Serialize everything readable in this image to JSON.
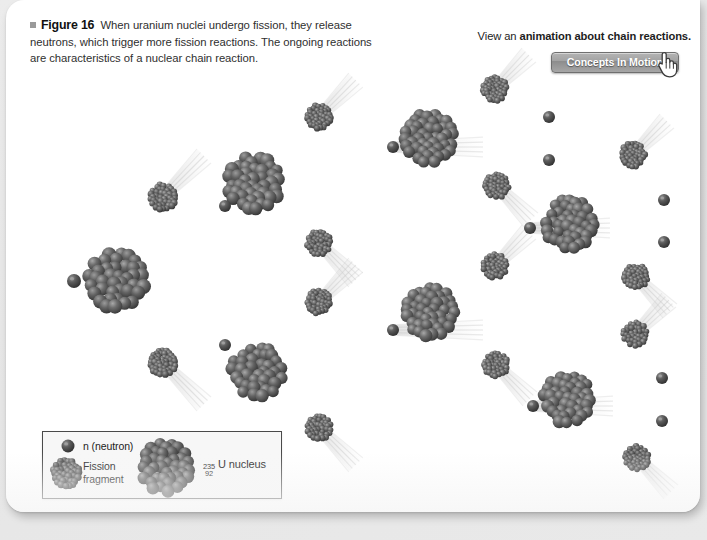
{
  "figure": {
    "bullet": "■",
    "label": "Figure 16",
    "caption": "When uranium nuclei undergo fission, they release neutrons, which trigger more fission reactions. The ongoing reactions are characteristics of a nuclear chain reaction."
  },
  "animation_note": {
    "prefix": "View an ",
    "bold": "animation about chain reactions."
  },
  "button": {
    "label": "Concepts In Motion",
    "cursor_icon": "hand-pointer-icon"
  },
  "legend": {
    "neutron_label": "n (neutron)",
    "fragment_label_line1": "Fission",
    "fragment_label_line2": "fragment",
    "uranium_mass_number": "235",
    "uranium_atomic_number": "92",
    "uranium_label": "U nucleus"
  },
  "colors": {
    "page_background": "#e8e8e8",
    "card": "#ffffff",
    "nucleon_dark": "#4a4a4a",
    "nucleon_mid": "#5e5e5e",
    "nucleon_light": "#8e8e8e",
    "trail": "#cfcfcf",
    "button_gray": "#a2a2a2",
    "legend_border": "#4a4a4a",
    "text": "#2e2e2e"
  },
  "diagram": {
    "type": "nuclear-chain-reaction-schematic",
    "generations": 3,
    "uranium_nuclei": [
      {
        "id": "u-gen1",
        "cx": 110,
        "cy": 281,
        "r": 33,
        "generation": 1
      },
      {
        "id": "u-gen2-top",
        "cx": 248,
        "cy": 183,
        "r": 31,
        "generation": 2
      },
      {
        "id": "u-gen2-bottom",
        "cx": 251,
        "cy": 372,
        "r": 30,
        "generation": 2
      },
      {
        "id": "u-gen3-a",
        "cx": 423,
        "cy": 138,
        "r": 29,
        "generation": 3
      },
      {
        "id": "u-gen3-b",
        "cx": 563,
        "cy": 224,
        "r": 29,
        "generation": 3
      },
      {
        "id": "u-gen3-c",
        "cx": 424,
        "cy": 312,
        "r": 29,
        "generation": 3
      },
      {
        "id": "u-gen3-d",
        "cx": 562,
        "cy": 399,
        "r": 29,
        "generation": 3
      }
    ],
    "fission_fragments": [
      {
        "id": "f1",
        "cx": 157,
        "cy": 197,
        "r": 15
      },
      {
        "id": "f2",
        "cx": 157,
        "cy": 363,
        "r": 15
      },
      {
        "id": "f3",
        "cx": 313,
        "cy": 117,
        "r": 14
      },
      {
        "id": "f4",
        "cx": 313,
        "cy": 243,
        "r": 14
      },
      {
        "id": "f5",
        "cx": 313,
        "cy": 302,
        "r": 14
      },
      {
        "id": "f6",
        "cx": 313,
        "cy": 428,
        "r": 14
      },
      {
        "id": "f7",
        "cx": 489,
        "cy": 89,
        "r": 14
      },
      {
        "id": "f8",
        "cx": 491,
        "cy": 186,
        "r": 14
      },
      {
        "id": "f9",
        "cx": 627,
        "cy": 155,
        "r": 14
      },
      {
        "id": "f10",
        "cx": 630,
        "cy": 277,
        "r": 14
      },
      {
        "id": "f11",
        "cx": 489,
        "cy": 266,
        "r": 14
      },
      {
        "id": "f12",
        "cx": 490,
        "cy": 365,
        "r": 14
      },
      {
        "id": "f13",
        "cx": 629,
        "cy": 334,
        "r": 14
      },
      {
        "id": "f14",
        "cx": 631,
        "cy": 458,
        "r": 14
      }
    ],
    "neutrons": [
      {
        "id": "n-incoming",
        "cx": 68,
        "cy": 281,
        "r": 7
      },
      {
        "id": "n-a",
        "cx": 219,
        "cy": 206,
        "r": 6
      },
      {
        "id": "n-b",
        "cx": 219,
        "cy": 345,
        "r": 6
      },
      {
        "id": "n-c",
        "cx": 387,
        "cy": 147,
        "r": 6
      },
      {
        "id": "n-d",
        "cx": 387,
        "cy": 330,
        "r": 6
      },
      {
        "id": "n-e",
        "cx": 524,
        "cy": 228,
        "r": 6
      },
      {
        "id": "n-f",
        "cx": 527,
        "cy": 406,
        "r": 6
      },
      {
        "id": "n-g",
        "cx": 543,
        "cy": 117,
        "r": 6
      },
      {
        "id": "n-h",
        "cx": 543,
        "cy": 160,
        "r": 6
      },
      {
        "id": "n-i",
        "cx": 658,
        "cy": 200,
        "r": 6
      },
      {
        "id": "n-j",
        "cx": 658,
        "cy": 242,
        "r": 6
      },
      {
        "id": "n-k",
        "cx": 656,
        "cy": 378,
        "r": 6
      },
      {
        "id": "n-l",
        "cx": 656,
        "cy": 421,
        "r": 6
      }
    ],
    "motion_trails": [
      {
        "id": "t-f1",
        "x": 157,
        "y": 197,
        "angle": 135,
        "len": 58
      },
      {
        "id": "t-f2",
        "x": 157,
        "y": 363,
        "angle": 225,
        "len": 58
      },
      {
        "id": "t-f3",
        "x": 313,
        "y": 117,
        "angle": 135,
        "len": 52
      },
      {
        "id": "t-f4",
        "x": 313,
        "y": 243,
        "angle": 225,
        "len": 52
      },
      {
        "id": "t-f5",
        "x": 313,
        "y": 302,
        "angle": 135,
        "len": 52
      },
      {
        "id": "t-f6",
        "x": 313,
        "y": 428,
        "angle": 225,
        "len": 52
      },
      {
        "id": "t-f7",
        "x": 489,
        "y": 89,
        "angle": 135,
        "len": 48
      },
      {
        "id": "t-f8",
        "x": 491,
        "y": 186,
        "angle": 225,
        "len": 48
      },
      {
        "id": "t-f9",
        "x": 627,
        "y": 155,
        "angle": 135,
        "len": 48
      },
      {
        "id": "t-f10",
        "x": 630,
        "y": 277,
        "angle": 225,
        "len": 48
      },
      {
        "id": "t-f11",
        "x": 489,
        "y": 266,
        "angle": 135,
        "len": 48
      },
      {
        "id": "t-f12",
        "x": 490,
        "y": 365,
        "angle": 225,
        "len": 48
      },
      {
        "id": "t-f13",
        "x": 629,
        "y": 334,
        "angle": 135,
        "len": 48
      },
      {
        "id": "t-f14",
        "x": 631,
        "y": 458,
        "angle": 225,
        "len": 48
      },
      {
        "id": "t-n-c",
        "x": 387,
        "y": 147,
        "angle": 180,
        "len": 90
      },
      {
        "id": "t-n-d",
        "x": 387,
        "y": 330,
        "angle": 180,
        "len": 90
      },
      {
        "id": "t-n-e",
        "x": 524,
        "y": 228,
        "angle": 180,
        "len": 80
      },
      {
        "id": "t-n-f",
        "x": 527,
        "y": 406,
        "angle": 180,
        "len": 80
      }
    ]
  }
}
